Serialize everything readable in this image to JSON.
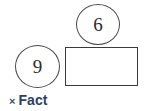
{
  "diagram": {
    "type": "multiplication-fact-family-bar-model",
    "nodes": [
      {
        "id": "ellipse-six",
        "shape": "ellipse",
        "value": "6",
        "name": "factor-circle-six"
      },
      {
        "id": "ellipse-nine",
        "shape": "ellipse",
        "value": "9",
        "name": "factor-circle-nine"
      },
      {
        "id": "rect-blank",
        "shape": "rectangle",
        "value": "",
        "name": "product-rectangle-blank"
      }
    ],
    "caption": {
      "operator_symbol": "×",
      "label": "Fact",
      "full_text": "× Fact"
    },
    "colors": {
      "outline": "#4a4a4a",
      "rectangle_outline": "#3a3a3a",
      "digit_text": "#2b2b2b",
      "caption_text": "#2e3f63",
      "caption_operator": "#3f4f6b",
      "background": "#ffffff"
    }
  }
}
